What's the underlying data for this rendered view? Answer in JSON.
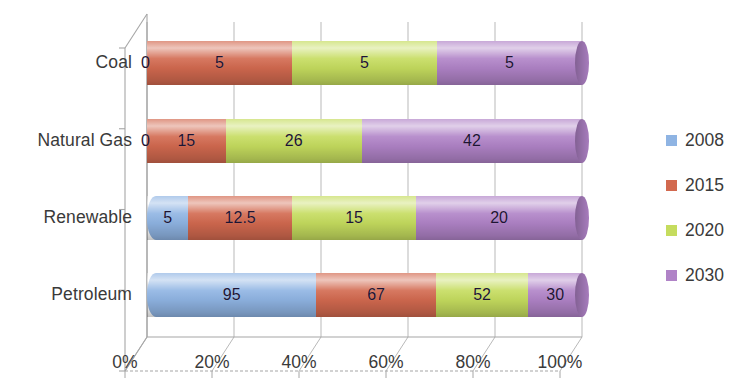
{
  "chart_data": {
    "type": "bar",
    "subtype": "stacked-bar-100-horizontal-3d",
    "title": "",
    "xlabel": "",
    "ylabel": "",
    "orientation": "horizontal",
    "stacked": true,
    "normalized_to_percent": true,
    "grid": true,
    "legend_position": "right",
    "xlim": [
      0,
      100
    ],
    "xticks": [
      "0%",
      "20%",
      "40%",
      "60%",
      "80%",
      "100%"
    ],
    "xtick_values": [
      0,
      20,
      40,
      60,
      80,
      100
    ],
    "categories": [
      "Coal",
      "Natural Gas",
      "Renewable",
      "Petroleum"
    ],
    "series": [
      {
        "name": "2008",
        "color": "#8FB4E3",
        "values": [
          0,
          0,
          5,
          95
        ]
      },
      {
        "name": "2015",
        "color": "#D2694F",
        "values": [
          5,
          15,
          12.5,
          67
        ]
      },
      {
        "name": "2020",
        "color": "#C5DC5E",
        "values": [
          5,
          26,
          15,
          52
        ]
      },
      {
        "name": "2030",
        "color": "#B083C7",
        "values": [
          5,
          42,
          20,
          30
        ]
      }
    ],
    "row_totals": [
      15,
      83,
      52.5,
      244
    ]
  },
  "rows": [
    {
      "label": "Coal",
      "top": 41,
      "height": 44,
      "segments": [
        {
          "series": "2008",
          "label": "0",
          "value": 0,
          "percent": 0,
          "color": "#8FB4E3"
        },
        {
          "series": "2015",
          "label": "5",
          "value": 5,
          "percent": 33.33,
          "color": "#D2694F"
        },
        {
          "series": "2020",
          "label": "5",
          "value": 5,
          "percent": 33.33,
          "color": "#C5DC5E"
        },
        {
          "series": "2030",
          "label": "5",
          "value": 5,
          "percent": 33.34,
          "color": "#B083C7"
        }
      ]
    },
    {
      "label": "Natural Gas",
      "top": 119,
      "height": 44,
      "segments": [
        {
          "series": "2008",
          "label": "0",
          "value": 0,
          "percent": 0,
          "color": "#8FB4E3"
        },
        {
          "series": "2015",
          "label": "15",
          "value": 15,
          "percent": 18.07,
          "color": "#D2694F"
        },
        {
          "series": "2020",
          "label": "26",
          "value": 26,
          "percent": 31.33,
          "color": "#C5DC5E"
        },
        {
          "series": "2030",
          "label": "42",
          "value": 42,
          "percent": 50.6,
          "color": "#B083C7"
        }
      ]
    },
    {
      "label": "Renewable",
      "top": 196,
      "height": 44,
      "segments": [
        {
          "series": "2008",
          "label": "5",
          "value": 5,
          "percent": 9.52,
          "color": "#8FB4E3"
        },
        {
          "series": "2015",
          "label": "12.5",
          "value": 12.5,
          "percent": 23.81,
          "color": "#D2694F"
        },
        {
          "series": "2020",
          "label": "15",
          "value": 15,
          "percent": 28.57,
          "color": "#C5DC5E"
        },
        {
          "series": "2030",
          "label": "20",
          "value": 20,
          "percent": 38.1,
          "color": "#B083C7"
        }
      ]
    },
    {
      "label": "Petroleum",
      "top": 273,
      "height": 44,
      "segments": [
        {
          "series": "2008",
          "label": "95",
          "value": 95,
          "percent": 38.93,
          "color": "#8FB4E3"
        },
        {
          "series": "2015",
          "label": "67",
          "value": 67,
          "percent": 27.46,
          "color": "#D2694F"
        },
        {
          "series": "2020",
          "label": "52",
          "value": 52,
          "percent": 21.31,
          "color": "#C5DC5E"
        },
        {
          "series": "2030",
          "label": "30",
          "value": 30,
          "percent": 12.3,
          "color": "#B083C7"
        }
      ]
    }
  ],
  "axis": {
    "ticks": [
      {
        "label": "0%",
        "x": 147
      },
      {
        "label": "20%",
        "x": 234
      },
      {
        "label": "40%",
        "x": 321
      },
      {
        "label": "60%",
        "x": 408
      },
      {
        "label": "80%",
        "x": 495
      },
      {
        "label": "100%",
        "x": 582
      }
    ]
  },
  "legend": {
    "items": [
      {
        "label": "2008",
        "color": "#8FB4E3"
      },
      {
        "label": "2015",
        "color": "#D2694F"
      },
      {
        "label": "2020",
        "color": "#C5DC5E"
      },
      {
        "label": "2030",
        "color": "#B083C7"
      }
    ]
  }
}
